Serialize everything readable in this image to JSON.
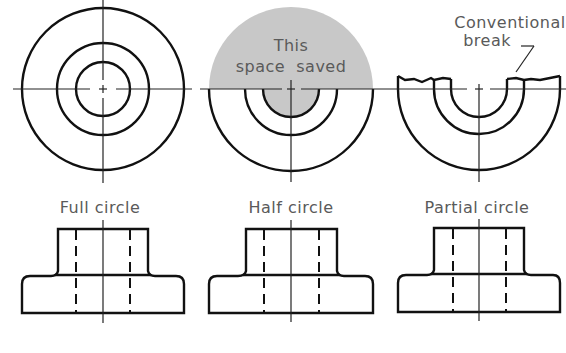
{
  "figure": {
    "views": [
      {
        "id": "full",
        "label": "Full circle"
      },
      {
        "id": "half",
        "label": "Half circle",
        "annotation_line1": "This",
        "annotation_line2": "space  saved"
      },
      {
        "id": "partial",
        "label": "Partial circle",
        "annotation_line1": "Conventional",
        "annotation_line2": "break"
      }
    ],
    "colors": {
      "line": "#111111",
      "shade": "#c8c8c8",
      "text": "#5a5a5a"
    }
  }
}
